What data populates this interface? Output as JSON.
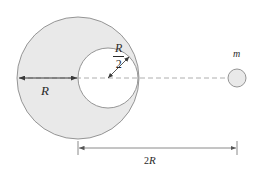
{
  "figure": {
    "background_color": "#ffffff",
    "shape_fill_color": "#e9e9e9",
    "shape_stroke_color": "#8a8a8a",
    "cavity_fill_color": "#ffffff",
    "axis_color": "#9a9a9a",
    "arrow_color": "#3a3a3a",
    "dimension_color": "#7d7d7d",
    "label_color": "#2a2a2a",
    "labels": {
      "big_radius": "R",
      "cavity_radius_numerator": "R",
      "cavity_radius_denominator": "2",
      "point_mass": "m",
      "separation_coefficient": "2",
      "separation_symbol": "R"
    },
    "geometry": {
      "big_circle": {
        "cx": 78,
        "cy": 78,
        "r": 61
      },
      "cavity_circle": {
        "cx": 108,
        "cy": 78,
        "r": 30
      },
      "point_mass_circle": {
        "cx": 237,
        "cy": 78,
        "r": 9
      },
      "axis_line": {
        "x1": 17,
        "y1": 78,
        "x2": 237,
        "y2": 78
      },
      "radius_arrow": {
        "x1": 18,
        "y1": 78,
        "x2": 78,
        "y2": 78
      },
      "cavity_radius_arrow": {
        "x1": 108,
        "y1": 78,
        "x2": 129,
        "y2": 57
      },
      "dimension_line": {
        "x1": 78,
        "y1": 148,
        "x2": 237,
        "y2": 148
      }
    }
  }
}
